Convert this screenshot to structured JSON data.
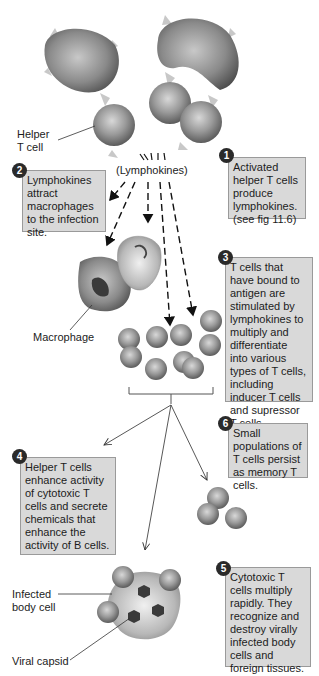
{
  "labels": {
    "helper_t_cell": "Helper\nT cell",
    "lymphokines": "(Lymphokines)",
    "macrophage": "Macrophage",
    "infected_body_cell": "Infected\nbody cell",
    "viral_capsid": "Viral capsid"
  },
  "steps": [
    {
      "number": "1",
      "text": "Activated helper T cells produce lymphokines. (see fig 11.6)"
    },
    {
      "number": "2",
      "text": "Lymphokines attract macrophages to the infection site."
    },
    {
      "number": "3",
      "text": "T cells that have bound to antigen are stimulated by lymphokines to multiply and differentiate into various types of T cells, including inducer T cells and supressor T cells."
    },
    {
      "number": "4",
      "text": "Helper T cells enhance activity of cytotoxic T cells and secrete chemicals that enhance the activity of B cells."
    },
    {
      "number": "5",
      "text": "Cytotoxic T cells multiply rapidly. They recognize and destroy virally infected body cells and foreign tissues."
    },
    {
      "number": "6",
      "text": "Small populations of T cells persist as memory T cells."
    }
  ],
  "colors": {
    "box_fill": "#d9d9d9",
    "box_border": "#9a9a9a",
    "badge": "#2a2a2a",
    "cell": "#8a8a8a"
  }
}
